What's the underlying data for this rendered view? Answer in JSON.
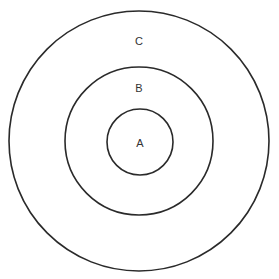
{
  "diagram": {
    "type": "concentric-circles",
    "stroke_color": "#2a2a2a",
    "label_color": "#333333",
    "circles": [
      {
        "id": "C",
        "label": "C",
        "cx": 139,
        "cy": 141,
        "r": 130,
        "label_x": 139,
        "label_y": 41
      },
      {
        "id": "B",
        "label": "B",
        "cx": 139,
        "cy": 141,
        "r": 74,
        "label_x": 139,
        "label_y": 88
      },
      {
        "id": "A",
        "label": "A",
        "cx": 140,
        "cy": 142,
        "r": 33,
        "label_x": 140,
        "label_y": 143
      }
    ]
  }
}
